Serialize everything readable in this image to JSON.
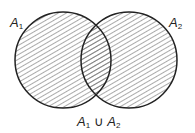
{
  "diagram": {
    "type": "venn",
    "sets": [
      {
        "name": "A",
        "index": "1"
      },
      {
        "name": "A",
        "index": "2"
      }
    ],
    "caption": {
      "left": "A",
      "left_index": "1",
      "op": " ∪ ",
      "right": "A",
      "right_index": "2"
    },
    "shaded_region": "union",
    "colors": {
      "stroke": "#222222",
      "hatch": "#444444",
      "background": "#ffffff"
    }
  }
}
